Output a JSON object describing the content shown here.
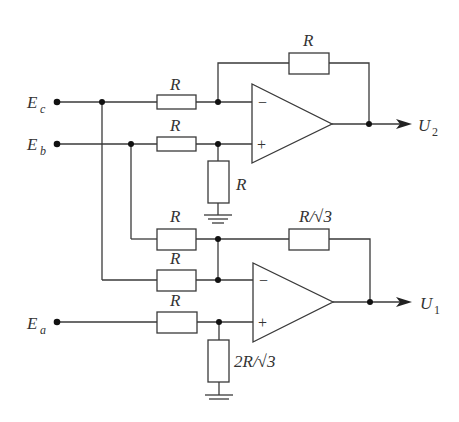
{
  "diagram": {
    "type": "op-amp circuit schematic",
    "inputs": [
      {
        "id": "Ec",
        "label": "E",
        "sub": "c"
      },
      {
        "id": "Eb",
        "label": "E",
        "sub": "b"
      },
      {
        "id": "Ea",
        "label": "E",
        "sub": "a"
      }
    ],
    "outputs": [
      {
        "id": "U2",
        "label": "U",
        "sub": "2"
      },
      {
        "id": "U1",
        "label": "U",
        "sub": "1"
      }
    ],
    "resistors": {
      "amp2_feedback": "R",
      "amp2_in_minus": "R",
      "amp2_in_plus": "R",
      "amp2_shunt": "R",
      "amp1_feedback": "R/√3",
      "amp1_in_from_Eb": "R",
      "amp1_in_from_Ec": "R",
      "amp1_in_plus": "R",
      "amp1_shunt": "2R/√3"
    },
    "signs": {
      "minus": "−",
      "plus": "+"
    }
  }
}
